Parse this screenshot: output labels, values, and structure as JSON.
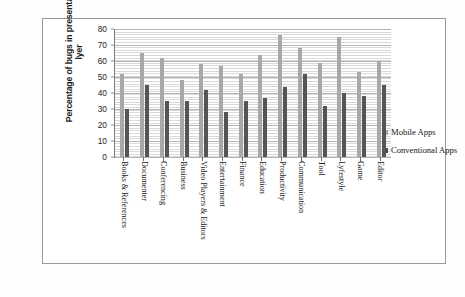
{
  "chart_data": {
    "type": "bar",
    "title": "",
    "subtitle": "",
    "xlabel": "",
    "ylabel": "Percentage of bugs in presentation lyer",
    "ylabel_lines": [
      "Percentage of bugs in presentation",
      "lyer"
    ],
    "ylim": [
      0,
      80
    ],
    "ytick_step": 10,
    "yticks": [
      80,
      70,
      60,
      50,
      40,
      30,
      20,
      10,
      0
    ],
    "grid": true,
    "grid_orientation": "horizontal",
    "legend_position": "right",
    "categories": [
      "Books & References",
      "Documenter",
      "Conferencing",
      "Business",
      "Video Players & Editors",
      "Entertainment",
      "Finance",
      "Education",
      "Productivity",
      "Communication",
      "Tool",
      "Lyfestyle",
      "Game",
      "Editor"
    ],
    "series": [
      {
        "name": "Mobile Apps",
        "color": "#a8a8a8",
        "values": [
          52,
          65,
          62,
          48,
          58,
          57,
          52,
          64,
          76,
          68,
          59,
          75,
          53,
          60
        ]
      },
      {
        "name": "Conventional Apps",
        "color": "#555555",
        "values": [
          30,
          45,
          35,
          35,
          42,
          28,
          35,
          37,
          44,
          52,
          32,
          40,
          38,
          45
        ]
      }
    ]
  },
  "legend": {
    "items": [
      {
        "label": "Mobile Apps"
      },
      {
        "label": "Conventional Apps"
      }
    ]
  }
}
